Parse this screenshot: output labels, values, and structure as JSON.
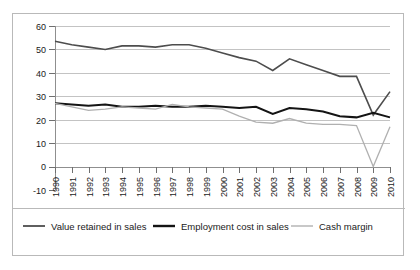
{
  "chart_data": {
    "type": "line",
    "title": "",
    "subtitle": "",
    "xlabel": "",
    "ylabel": "",
    "grid": "horizontal",
    "legend_position": "bottom",
    "xlim": [
      1990,
      2010
    ],
    "ylim": [
      -10,
      60
    ],
    "ytick_step": 10,
    "categories": [
      "1990",
      "1991",
      "1992",
      "1993",
      "1994",
      "1995",
      "1996",
      "1997",
      "1998",
      "1999",
      "2000",
      "2001",
      "2002",
      "2003",
      "2004",
      "2005",
      "2006",
      "2007",
      "2008",
      "2009",
      "2010"
    ],
    "ytick_labels": [
      "60",
      "50",
      "40",
      "30",
      "20",
      "10",
      "0",
      "-10"
    ],
    "ytick_values": [
      60,
      50,
      40,
      30,
      20,
      10,
      0,
      -10
    ],
    "series": [
      {
        "name": "Value retained in sales",
        "color": "#4d4d4d",
        "width": 1.6,
        "values": [
          53.5,
          52.0,
          51.0,
          50.0,
          51.5,
          51.5,
          51.0,
          52.0,
          52.0,
          50.5,
          48.5,
          46.5,
          45.0,
          41.0,
          46.0,
          43.5,
          41.0,
          38.5,
          38.5,
          22.0,
          32.0
        ]
      },
      {
        "name": "Employment cost in sales",
        "color": "#141414",
        "width": 2.0,
        "values": [
          27.0,
          26.5,
          26.0,
          26.5,
          25.5,
          25.5,
          26.0,
          25.5,
          25.5,
          26.0,
          25.5,
          25.0,
          25.5,
          22.5,
          25.0,
          24.5,
          23.5,
          21.5,
          21.0,
          23.0,
          21.0
        ]
      },
      {
        "name": "Cash margin",
        "color": "#b0b0b0",
        "width": 1.3,
        "values": [
          27.0,
          25.5,
          24.0,
          24.5,
          25.5,
          25.0,
          24.5,
          26.5,
          25.5,
          25.0,
          24.5,
          21.5,
          19.0,
          18.5,
          20.5,
          18.5,
          18.0,
          18.0,
          17.5,
          0.0,
          17.0
        ]
      }
    ]
  },
  "legend": {
    "items": [
      {
        "label": "Value retained in sales",
        "color": "#4d4d4d",
        "width": 1.8
      },
      {
        "label": "Employment cost in sales",
        "color": "#141414",
        "width": 2.4
      },
      {
        "label": "Cash margin",
        "color": "#b0b0b0",
        "width": 1.4
      }
    ]
  }
}
